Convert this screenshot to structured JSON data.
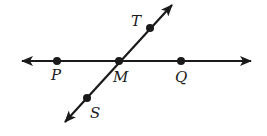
{
  "diagram": {
    "colors": {
      "stroke": "#1a1a1a",
      "background": "#ffffff"
    },
    "lines": [
      {
        "name": "line-PQ",
        "from": [
          22,
          61
        ],
        "to": [
          251,
          61
        ],
        "arrows": "both"
      },
      {
        "name": "line-ST",
        "from": [
          65,
          122
        ],
        "to": [
          172,
          5
        ],
        "arrows": "both"
      }
    ],
    "points": [
      {
        "label": "P",
        "x": 57,
        "y": 61,
        "label_x": 51,
        "label_y": 80
      },
      {
        "label": "M",
        "x": 119,
        "y": 61,
        "label_x": 113,
        "label_y": 82
      },
      {
        "label": "Q",
        "x": 181,
        "y": 61,
        "label_x": 175,
        "label_y": 82
      },
      {
        "label": "T",
        "x": 150,
        "y": 28,
        "label_x": 131,
        "label_y": 26
      },
      {
        "label": "S",
        "x": 87,
        "y": 98,
        "label_x": 90,
        "label_y": 118
      }
    ]
  }
}
